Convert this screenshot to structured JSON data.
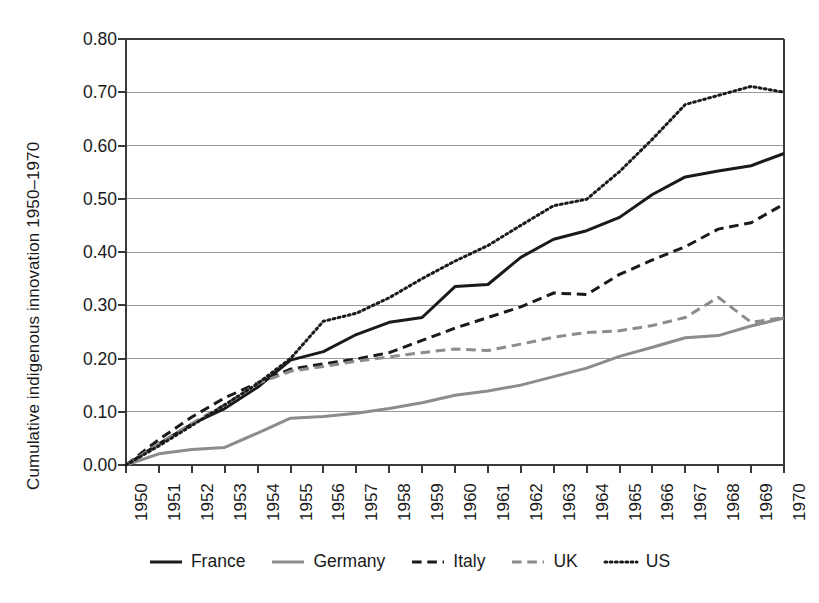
{
  "chart_data": {
    "type": "line",
    "title": "",
    "xlabel": "",
    "ylabel": "Cumulative indigenous innovation 1950–1970",
    "xlim": [
      1950,
      1970
    ],
    "ylim": [
      0.0,
      0.8
    ],
    "ytick_labels": [
      "0.00",
      "0.10",
      "0.20",
      "0.30",
      "0.40",
      "0.50",
      "0.60",
      "0.70",
      "0.80"
    ],
    "ytick_values": [
      0.0,
      0.1,
      0.2,
      0.3,
      0.4,
      0.5,
      0.6,
      0.7,
      0.8
    ],
    "grid": "horizontal",
    "legend_position": "bottom",
    "categories": [
      1950,
      1951,
      1952,
      1953,
      1954,
      1955,
      1956,
      1957,
      1958,
      1959,
      1960,
      1961,
      1962,
      1963,
      1964,
      1965,
      1966,
      1967,
      1968,
      1969,
      1970
    ],
    "xtick_labels": [
      "1950",
      "1951",
      "1952",
      "1953",
      "1954",
      "1955",
      "1956",
      "1957",
      "1958",
      "1959",
      "1960",
      "1961",
      "1962",
      "1963",
      "1964",
      "1965",
      "1966",
      "1967",
      "1968",
      "1969",
      "1970"
    ],
    "series": [
      {
        "name": "France",
        "color": "#1a1a1a",
        "style": "solid",
        "width": 3.0,
        "values": [
          0.0,
          0.04,
          0.077,
          0.106,
          0.146,
          0.197,
          0.213,
          0.245,
          0.268,
          0.277,
          0.335,
          0.339,
          0.39,
          0.424,
          0.44,
          0.465,
          0.508,
          0.541,
          0.552,
          0.562,
          0.585
        ]
      },
      {
        "name": "Germany",
        "color": "#8c8c8c",
        "style": "solid",
        "width": 3.0,
        "values": [
          0.0,
          0.021,
          0.029,
          0.033,
          0.06,
          0.088,
          0.091,
          0.097,
          0.106,
          0.117,
          0.131,
          0.139,
          0.15,
          0.166,
          0.182,
          0.204,
          0.221,
          0.239,
          0.243,
          0.261,
          0.276
        ]
      },
      {
        "name": "Italy",
        "color": "#1a1a1a",
        "style": "dashed",
        "width": 3.0,
        "values": [
          0.0,
          0.048,
          0.09,
          0.126,
          0.154,
          0.18,
          0.19,
          0.199,
          0.211,
          0.234,
          0.257,
          0.277,
          0.297,
          0.323,
          0.32,
          0.358,
          0.385,
          0.41,
          0.443,
          0.455,
          0.49
        ]
      },
      {
        "name": "UK",
        "color": "#8c8c8c",
        "style": "dashed",
        "width": 3.0,
        "values": [
          0.0,
          0.04,
          0.078,
          0.113,
          0.153,
          0.176,
          0.185,
          0.195,
          0.203,
          0.211,
          0.218,
          0.215,
          0.227,
          0.24,
          0.249,
          0.252,
          0.262,
          0.277,
          0.315,
          0.268,
          0.277
        ]
      },
      {
        "name": "US",
        "color": "#1a1a1a",
        "style": "dotted",
        "width": 3.0,
        "values": [
          0.0,
          0.036,
          0.074,
          0.113,
          0.153,
          0.2,
          0.27,
          0.285,
          0.314,
          0.35,
          0.383,
          0.412,
          0.45,
          0.487,
          0.499,
          0.551,
          0.612,
          0.677,
          0.694,
          0.711,
          0.7
        ]
      }
    ]
  },
  "legend": {
    "items": [
      {
        "label": "France",
        "swatch": "line-solid-black-icon"
      },
      {
        "label": "Germany",
        "swatch": "line-solid-gray-icon"
      },
      {
        "label": "Italy",
        "swatch": "line-dashed-black-icon"
      },
      {
        "label": "UK",
        "swatch": "line-dashed-gray-icon"
      },
      {
        "label": "US",
        "swatch": "line-dotted-black-icon"
      }
    ]
  },
  "colors": {
    "dark": "#1a1a1a",
    "gray": "#8c8c8c",
    "grid": "#9a9a9a",
    "axis": "#3a3a3a",
    "background": "#ffffff"
  }
}
